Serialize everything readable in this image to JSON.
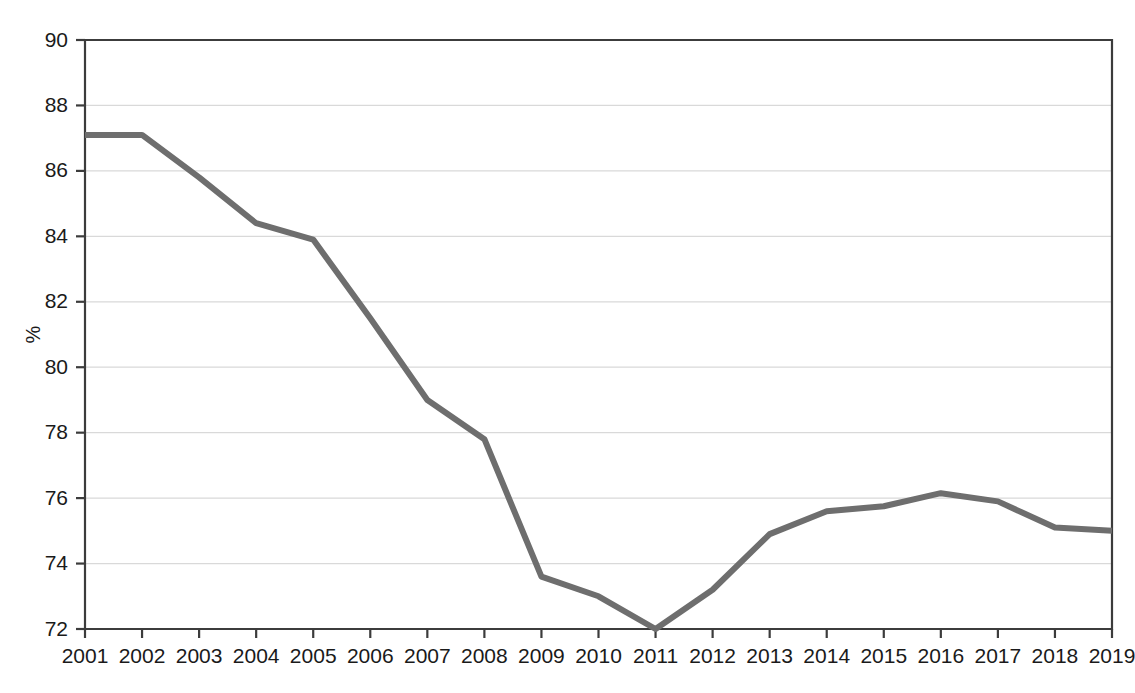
{
  "chart_data": {
    "type": "line",
    "title": "",
    "subtitle": "",
    "xlabel": "",
    "ylabel": "%",
    "x": [
      2001,
      2002,
      2003,
      2004,
      2005,
      2006,
      2007,
      2008,
      2009,
      2010,
      2011,
      2012,
      2013,
      2014,
      2015,
      2016,
      2017,
      2018,
      2019
    ],
    "categories": [
      "2001",
      "2002",
      "2003",
      "2004",
      "2005",
      "2006",
      "2007",
      "2008",
      "2009",
      "2010",
      "2011",
      "2012",
      "2013",
      "2014",
      "2015",
      "2016",
      "2017",
      "2018",
      "2019"
    ],
    "values": [
      87.1,
      87.1,
      85.8,
      84.4,
      83.9,
      81.5,
      79.0,
      77.8,
      73.6,
      73.0,
      72.0,
      73.2,
      74.9,
      75.6,
      75.75,
      76.15,
      75.9,
      75.1,
      75.0
    ],
    "series": [
      {
        "name": "",
        "values": [
          87.1,
          87.1,
          85.8,
          84.4,
          83.9,
          81.5,
          79.0,
          77.8,
          73.6,
          73.0,
          72.0,
          73.2,
          74.9,
          75.6,
          75.75,
          76.15,
          75.9,
          75.1,
          75.0
        ],
        "color": "#6e6e6e"
      }
    ],
    "ylim": [
      72,
      90
    ],
    "yticks": [
      72,
      74,
      76,
      78,
      80,
      82,
      84,
      86,
      88,
      90
    ],
    "ytick_labels": [
      "72",
      "74",
      "76",
      "78",
      "80",
      "82",
      "84",
      "86",
      "88",
      "90"
    ],
    "xlim": [
      2001,
      2019
    ],
    "xticks": [
      2001,
      2002,
      2003,
      2004,
      2005,
      2006,
      2007,
      2008,
      2009,
      2010,
      2011,
      2012,
      2013,
      2014,
      2015,
      2016,
      2017,
      2018,
      2019
    ],
    "grid": true,
    "grid_axis": "y",
    "legend": false,
    "legend_position": "none",
    "colors": {
      "line": "#6e6e6e",
      "grid": "#d9d9d9",
      "axis": "#3c3c3c",
      "text": "#1a1a1a",
      "background": "#ffffff"
    },
    "line_width": 6,
    "annotations": []
  },
  "layout": {
    "plot_left": 85,
    "plot_right": 1112,
    "plot_top": 40,
    "plot_bottom": 629
  }
}
